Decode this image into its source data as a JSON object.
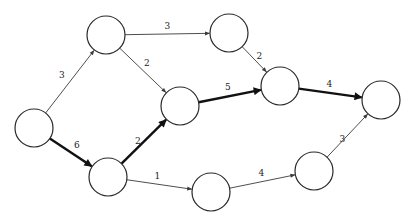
{
  "nodes": [
    {
      "id": "A",
      "label": ""
    },
    {
      "id": "B",
      "label": ""
    },
    {
      "id": "C",
      "label": ""
    },
    {
      "id": "D",
      "label": ""
    },
    {
      "id": "E",
      "label": ""
    },
    {
      "id": "F",
      "label": ""
    },
    {
      "id": "G",
      "label": ""
    },
    {
      "id": "H",
      "label": ""
    },
    {
      "id": "I",
      "label": ""
    }
  ],
  "edges": [
    {
      "from": "A",
      "to": "B",
      "weight": "3",
      "critical": false
    },
    {
      "from": "A",
      "to": "G",
      "weight": "6",
      "critical": true
    },
    {
      "from": "B",
      "to": "C",
      "weight": "3",
      "critical": false
    },
    {
      "from": "B",
      "to": "D",
      "weight": "2",
      "critical": false
    },
    {
      "from": "G",
      "to": "D",
      "weight": "2",
      "critical": true
    },
    {
      "from": "G",
      "to": "H",
      "weight": "1",
      "critical": false
    },
    {
      "from": "C",
      "to": "E",
      "weight": "2",
      "critical": false
    },
    {
      "from": "D",
      "to": "E",
      "weight": "5",
      "critical": true
    },
    {
      "from": "E",
      "to": "F",
      "weight": "4",
      "critical": true
    },
    {
      "from": "H",
      "to": "I",
      "weight": "4",
      "critical": false
    },
    {
      "from": "I",
      "to": "F",
      "weight": "3",
      "critical": false
    }
  ]
}
